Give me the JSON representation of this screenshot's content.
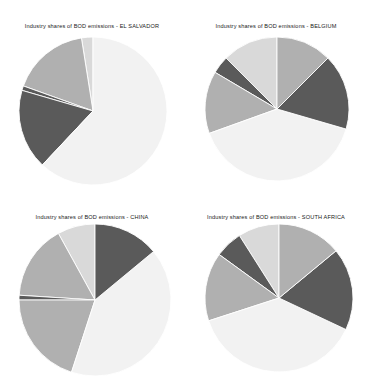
{
  "figure": {
    "background": "#ffffff",
    "width": 368,
    "height": 381,
    "layout": "2x2 grid of pie charts"
  },
  "palette": {
    "dark_gray": "#5a5a5a",
    "medium_gray": "#b0b0b0",
    "light_gray": "#d9d9d9",
    "very_light_gray": "#f2f2f2",
    "near_white": "#fafafa",
    "edge": "#ffffff",
    "text": "#1a1a1a"
  },
  "panels": [
    {
      "title": "Industry shares of BOD emissions - EL SALVADOR",
      "country": "EL SALVADOR",
      "radius": 74
    },
    {
      "title": "Industry shares of BOD emissions - BELGIUM",
      "country": "BELGIUM",
      "radius": 72
    },
    {
      "title": "Industry shares of BOD emissions - CHINA",
      "country": "CHINA",
      "radius": 76
    },
    {
      "title": "Industry shares of BOD emissions - SOUTH AFRICA",
      "country": "SOUTH AFRICA",
      "radius": 74
    }
  ],
  "chart_data": [
    {
      "type": "pie",
      "title": "Industry shares of BOD emissions - EL SALVADOR",
      "xlabel": "",
      "ylabel": "",
      "startangle": 90,
      "direction": "counterclockwise",
      "legend": "none",
      "grid": false,
      "categories": [
        "Slice 1",
        "Slice 2",
        "Slice 3",
        "Slice 4",
        "Slice 5"
      ],
      "values": [
        2.5,
        17.0,
        1.0,
        17.5,
        62.0
      ],
      "colors": [
        "#d9d9d9",
        "#b0b0b0",
        "#5a5a5a",
        "#5a5a5a",
        "#f2f2f2"
      ],
      "slices": [
        {
          "label": "Slice 1",
          "value": 2.5,
          "color": "#d9d9d9"
        },
        {
          "label": "Slice 2",
          "value": 17.0,
          "color": "#b0b0b0"
        },
        {
          "label": "Slice 3",
          "value": 1.0,
          "color": "#5a5a5a"
        },
        {
          "label": "Slice 4",
          "value": 17.5,
          "color": "#5a5a5a"
        },
        {
          "label": "Slice 5",
          "value": 62.0,
          "color": "#f2f2f2"
        }
      ]
    },
    {
      "type": "pie",
      "title": "Industry shares of BOD emissions - BELGIUM",
      "xlabel": "",
      "ylabel": "",
      "startangle": 90,
      "direction": "counterclockwise",
      "legend": "none",
      "grid": false,
      "categories": [
        "Slice 1",
        "Slice 2",
        "Slice 3",
        "Slice 4",
        "Slice 5",
        "Slice 6"
      ],
      "values": [
        12.5,
        4.0,
        14.0,
        40.0,
        17.0,
        12.5
      ],
      "colors": [
        "#d9d9d9",
        "#5a5a5a",
        "#b0b0b0",
        "#f2f2f2",
        "#5a5a5a",
        "#b0b0b0"
      ],
      "slices": [
        {
          "label": "Slice 1",
          "value": 12.5,
          "color": "#d9d9d9"
        },
        {
          "label": "Slice 2",
          "value": 4.0,
          "color": "#5a5a5a"
        },
        {
          "label": "Slice 3",
          "value": 14.0,
          "color": "#b0b0b0"
        },
        {
          "label": "Slice 4",
          "value": 40.0,
          "color": "#f2f2f2"
        },
        {
          "label": "Slice 5",
          "value": 17.0,
          "color": "#5a5a5a"
        },
        {
          "label": "Slice 6",
          "value": 12.5,
          "color": "#b0b0b0"
        }
      ]
    },
    {
      "type": "pie",
      "title": "Industry shares of BOD emissions - CHINA",
      "xlabel": "",
      "ylabel": "",
      "startangle": 90,
      "direction": "counterclockwise",
      "legend": "none",
      "grid": false,
      "categories": [
        "Slice 1",
        "Slice 2",
        "Slice 3",
        "Slice 4",
        "Slice 5",
        "Slice 6"
      ],
      "values": [
        8.0,
        16.0,
        1.0,
        20.0,
        41.0,
        14.0
      ],
      "colors": [
        "#d9d9d9",
        "#b0b0b0",
        "#5a5a5a",
        "#b0b0b0",
        "#f2f2f2",
        "#5a5a5a"
      ],
      "slices": [
        {
          "label": "Slice 1",
          "value": 8.0,
          "color": "#d9d9d9"
        },
        {
          "label": "Slice 2",
          "value": 16.0,
          "color": "#b0b0b0"
        },
        {
          "label": "Slice 3",
          "value": 1.0,
          "color": "#5a5a5a"
        },
        {
          "label": "Slice 4",
          "value": 20.0,
          "color": "#b0b0b0"
        },
        {
          "label": "Slice 5",
          "value": 41.0,
          "color": "#f2f2f2"
        },
        {
          "label": "Slice 6",
          "value": 14.0,
          "color": "#5a5a5a"
        }
      ]
    },
    {
      "type": "pie",
      "title": "Industry shares of BOD emissions - SOUTH AFRICA",
      "xlabel": "",
      "ylabel": "",
      "startangle": 90,
      "direction": "counterclockwise",
      "legend": "none",
      "grid": false,
      "categories": [
        "Slice 1",
        "Slice 2",
        "Slice 3",
        "Slice 4",
        "Slice 5",
        "Slice 6"
      ],
      "values": [
        9.0,
        6.0,
        15.0,
        38.0,
        18.0,
        14.0
      ],
      "colors": [
        "#d9d9d9",
        "#5a5a5a",
        "#b0b0b0",
        "#f2f2f2",
        "#5a5a5a",
        "#b0b0b0"
      ],
      "slices": [
        {
          "label": "Slice 1",
          "value": 9.0,
          "color": "#d9d9d9"
        },
        {
          "label": "Slice 2",
          "value": 6.0,
          "color": "#5a5a5a"
        },
        {
          "label": "Slice 3",
          "value": 15.0,
          "color": "#b0b0b0"
        },
        {
          "label": "Slice 4",
          "value": 38.0,
          "color": "#f2f2f2"
        },
        {
          "label": "Slice 5",
          "value": 18.0,
          "color": "#5a5a5a"
        },
        {
          "label": "Slice 6",
          "value": 14.0,
          "color": "#b0b0b0"
        }
      ]
    }
  ]
}
